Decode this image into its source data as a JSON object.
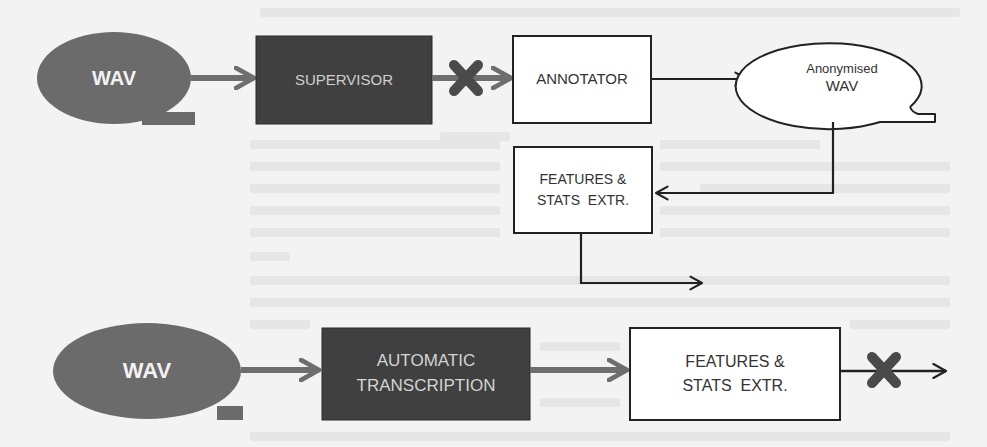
{
  "colors": {
    "background": "#f3f3f3",
    "source_fill": "#6b6b6b",
    "dark_box_fill": "#404040",
    "gray_arrow": "#6e6e6e",
    "black_line": "#222222",
    "white_box_fill": "#ffffff",
    "blocked_mark": "#4a4a4a"
  },
  "top_flow": {
    "source": {
      "label": "WAV"
    },
    "supervisor": {
      "label": "SUPERVISOR"
    },
    "annotator": {
      "label": "ANNOTATOR"
    },
    "anonymised": {
      "line1": "Anonymised",
      "line2": "WAV"
    },
    "features": {
      "line1": "FEATURES &",
      "line2": "STATS  EXTR."
    },
    "blocked_edge": "supervisor-to-annotator"
  },
  "bottom_flow": {
    "source": {
      "label": "WAV"
    },
    "transcription": {
      "line1": "AUTOMATIC",
      "line2": "TRANSCRIPTION"
    },
    "features": {
      "line1": "FEATURES &",
      "line2": "STATS  EXTR."
    },
    "blocked_edge": "features-to-output"
  }
}
